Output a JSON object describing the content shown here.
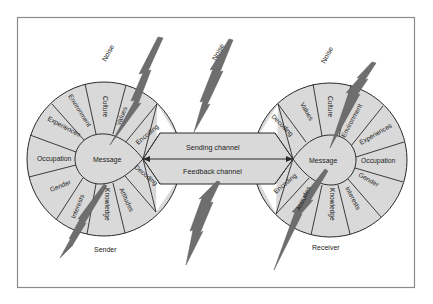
{
  "diagram": {
    "colors": {
      "segment_fill": "#d9d9d9",
      "stroke": "#2a2a2a",
      "frame": "#8a8a8a",
      "bolt": "#6e6e6e"
    },
    "noise_labels": [
      "Noise",
      "Noise",
      "Noise"
    ],
    "sender": {
      "label": "Sender",
      "center": "Message",
      "segments": [
        "Culture",
        "Values",
        "Encoding",
        "Decoding",
        "Attitudes",
        "Knowledge",
        "Interests",
        "Gender",
        "Occupation",
        "Experiences",
        "Environment"
      ]
    },
    "receiver": {
      "label": "Receiver",
      "center": "Message",
      "segments": [
        "Culture",
        "Environment",
        "Experiences",
        "Occupation",
        "Gender",
        "Interests",
        "Knowledge",
        "Attitudes",
        "Encoding",
        "Decoding",
        "Values"
      ]
    },
    "channels": {
      "sending": "Sending channel",
      "feedback": "Feedback channel"
    }
  }
}
